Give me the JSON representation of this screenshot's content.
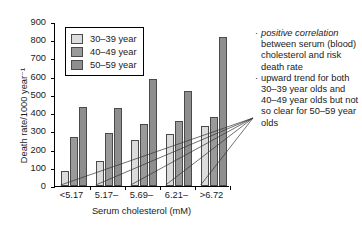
{
  "chart_data": {
    "type": "bar",
    "title": "",
    "subtitle": "",
    "xlabel": "Serum cholesterol (mM)",
    "ylabel": "Death rate/1000 year⁻¹",
    "categories": [
      "<5.17",
      "5.17–",
      "5.69–",
      "6.21–",
      ">6.72"
    ],
    "series": [
      {
        "name": "30–39 year",
        "color": "#dcdcdc",
        "values": [
          80,
          135,
          250,
          285,
          330
        ]
      },
      {
        "name": "40–49 year",
        "color": "#9a9a9a",
        "values": [
          270,
          293,
          343,
          358,
          378
        ]
      },
      {
        "name": "50–59 year",
        "color": "#8e8e8e",
        "values": [
          432,
          430,
          588,
          520,
          818
        ]
      }
    ],
    "ylim": [
      0,
      900
    ],
    "yticks": [
      0,
      100,
      200,
      300,
      400,
      500,
      600,
      700,
      800,
      900
    ],
    "ytick_labels": [
      "0",
      "100",
      "200",
      "300",
      "400",
      "500",
      "600",
      "700",
      "800",
      "900"
    ],
    "grid": false,
    "legend_position": "upper-left"
  },
  "legend": {
    "items": [
      {
        "label": "30–39 year",
        "color": "#dcdcdc"
      },
      {
        "label": "40–49 year",
        "color": "#9a9a9a"
      },
      {
        "label": "50–59 year",
        "color": "#8e8e8e"
      }
    ]
  },
  "annotation": {
    "items": [
      {
        "bullet": "·",
        "emphasis": "positive correlation",
        "rest": " between serum (blood) cholesterol and risk death rate"
      },
      {
        "bullet": "·",
        "emphasis": "",
        "rest": "upward trend for both 30–39 year olds and 40–49 year olds but not so clear for 50–59 year olds"
      }
    ]
  }
}
